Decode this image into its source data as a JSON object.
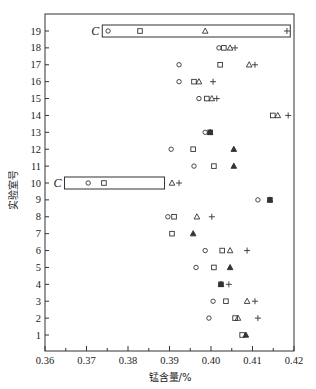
{
  "chart_data": {
    "type": "scatter",
    "title": "",
    "xlabel": "锰含量/%",
    "ylabel": "实验室号",
    "xlim": [
      0.36,
      0.42
    ],
    "ylim": [
      0,
      20
    ],
    "x_ticks": [
      "0.36",
      "0.37",
      "0.38",
      "0.39",
      "0.40",
      "0.41",
      "0.42"
    ],
    "y_ticks": [
      "1",
      "2",
      "3",
      "4",
      "5",
      "6",
      "7",
      "8",
      "9",
      "10",
      "11",
      "12",
      "13",
      "14",
      "15",
      "16",
      "17",
      "18",
      "19"
    ],
    "grid": false,
    "legend": null,
    "marker_types": {
      "circle": "○",
      "square": "□",
      "triangle": "△",
      "plus": "+"
    },
    "series": [
      {
        "name": "circle",
        "marker": "circle",
        "points": [
          {
            "lab": 19,
            "x": 0.3752
          },
          {
            "lab": 18,
            "x": 0.4019
          },
          {
            "lab": 17,
            "x": 0.3923
          },
          {
            "lab": 16,
            "x": 0.3923
          },
          {
            "lab": 15,
            "x": 0.3971
          },
          {
            "lab": 13,
            "x": 0.3986
          },
          {
            "lab": 12,
            "x": 0.3904
          },
          {
            "lab": 11,
            "x": 0.3959
          },
          {
            "lab": 10,
            "x": 0.3704
          },
          {
            "lab": 9,
            "x": 0.4113
          },
          {
            "lab": 8,
            "x": 0.3896
          },
          {
            "lab": 6,
            "x": 0.3986
          },
          {
            "lab": 5,
            "x": 0.3964
          },
          {
            "lab": 3,
            "x": 0.4005
          },
          {
            "lab": 2,
            "x": 0.3995
          }
        ]
      },
      {
        "name": "square",
        "marker": "square",
        "points": [
          {
            "lab": 19,
            "x": 0.3829
          },
          {
            "lab": 18,
            "x": 0.4031
          },
          {
            "lab": 17,
            "x": 0.4022
          },
          {
            "lab": 16,
            "x": 0.3959
          },
          {
            "lab": 15,
            "x": 0.399
          },
          {
            "lab": 14,
            "x": 0.4149
          },
          {
            "lab": 13,
            "x": 0.3998
          },
          {
            "lab": 12,
            "x": 0.3957
          },
          {
            "lab": 11,
            "x": 0.4007
          },
          {
            "lab": 10,
            "x": 0.3742
          },
          {
            "lab": 9,
            "x": 0.4142
          },
          {
            "lab": 8,
            "x": 0.3911
          },
          {
            "lab": 7,
            "x": 0.3906
          },
          {
            "lab": 6,
            "x": 0.4027
          },
          {
            "lab": 5,
            "x": 0.4007
          },
          {
            "lab": 4,
            "x": 0.4024
          },
          {
            "lab": 3,
            "x": 0.4036
          },
          {
            "lab": 2,
            "x": 0.4058
          },
          {
            "lab": 1,
            "x": 0.4075
          }
        ]
      },
      {
        "name": "triangle",
        "marker": "triangle",
        "points": [
          {
            "lab": 19,
            "x": 0.3986
          },
          {
            "lab": 18,
            "x": 0.4046
          },
          {
            "lab": 17,
            "x": 0.4092
          },
          {
            "lab": 16,
            "x": 0.3971
          },
          {
            "lab": 15,
            "x": 0.4002
          },
          {
            "lab": 14,
            "x": 0.4161
          },
          {
            "lab": 13,
            "x": 0.3998
          },
          {
            "lab": 12,
            "x": 0.4055
          },
          {
            "lab": 11,
            "x": 0.4055
          },
          {
            "lab": 10,
            "x": 0.3906
          },
          {
            "lab": 9,
            "x": 0.4142
          },
          {
            "lab": 8,
            "x": 0.3966
          },
          {
            "lab": 7,
            "x": 0.3957
          },
          {
            "lab": 6,
            "x": 0.4046
          },
          {
            "lab": 5,
            "x": 0.4046
          },
          {
            "lab": 4,
            "x": 0.4024
          },
          {
            "lab": 3,
            "x": 0.4087
          },
          {
            "lab": 2,
            "x": 0.4065
          },
          {
            "lab": 1,
            "x": 0.4084
          }
        ]
      },
      {
        "name": "plus",
        "marker": "plus",
        "points": [
          {
            "lab": 19,
            "x": 0.4183
          },
          {
            "lab": 18,
            "x": 0.4058
          },
          {
            "lab": 17,
            "x": 0.4106
          },
          {
            "lab": 16,
            "x": 0.4005
          },
          {
            "lab": 15,
            "x": 0.4014
          },
          {
            "lab": 14,
            "x": 0.4186
          },
          {
            "lab": 12,
            "x": 0.4055
          },
          {
            "lab": 11,
            "x": 0.4055
          },
          {
            "lab": 10,
            "x": 0.3923
          },
          {
            "lab": 9,
            "x": 0.4142
          },
          {
            "lab": 8,
            "x": 0.4002
          },
          {
            "lab": 7,
            "x": 0.3957
          },
          {
            "lab": 6,
            "x": 0.4087
          },
          {
            "lab": 5,
            "x": 0.4046
          },
          {
            "lab": 4,
            "x": 0.4043
          },
          {
            "lab": 3,
            "x": 0.4106
          },
          {
            "lab": 2,
            "x": 0.4113
          },
          {
            "lab": 1,
            "x": 0.4084
          }
        ]
      }
    ],
    "filled_overlaps": [
      {
        "lab": 13,
        "x": 0.3998
      },
      {
        "lab": 12,
        "x": 0.4055
      },
      {
        "lab": 11,
        "x": 0.4055
      },
      {
        "lab": 9,
        "x": 0.4142
      },
      {
        "lab": 7,
        "x": 0.3957
      },
      {
        "lab": 5,
        "x": 0.4046
      },
      {
        "lab": 4,
        "x": 0.4024
      },
      {
        "lab": 1,
        "x": 0.4084
      }
    ],
    "annotations": [
      {
        "label": "C",
        "lab": 19,
        "box_x": [
          0.3738,
          0.4191
        ],
        "note": "outlier lab boxed"
      },
      {
        "label": "C",
        "lab": 10,
        "box_x": [
          0.3647,
          0.3888
        ],
        "note": "outlier lab boxed"
      }
    ]
  }
}
